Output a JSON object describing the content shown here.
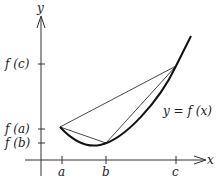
{
  "diagram": {
    "axes": {
      "x_label": "x",
      "y_label": "y"
    },
    "x_ticks": [
      {
        "id": "a",
        "label": "a"
      },
      {
        "id": "b",
        "label": "b"
      },
      {
        "id": "c",
        "label": "c"
      }
    ],
    "y_ticks": [
      {
        "id": "fc",
        "label": "f (c)"
      },
      {
        "id": "fa",
        "label": "f (a)"
      },
      {
        "id": "fb",
        "label": "f (b)"
      }
    ],
    "curve_label": "y = f (x)",
    "colors": {
      "ink": "#222222",
      "background": "#ffffff"
    }
  }
}
